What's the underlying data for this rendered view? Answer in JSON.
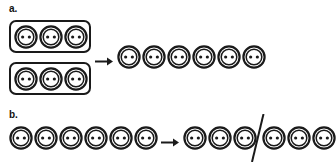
{
  "figure": {
    "background_color": "#ffffff",
    "stroke_color": "#1a1a1a",
    "parts": [
      {
        "label": "a.",
        "label_pos": {
          "x": 9,
          "y": 4
        },
        "operation": "combine",
        "groups": [
          {
            "kind": "boxed-group",
            "count": 3,
            "box": {
              "x": 9,
              "y": 20,
              "w": 82,
              "h": 33
            }
          },
          {
            "kind": "boxed-group",
            "count": 3,
            "box": {
              "x": 9,
              "y": 62,
              "w": 82,
              "h": 33
            }
          }
        ],
        "arrow": {
          "x": 95,
          "y": 57,
          "w": 18,
          "h": 8,
          "direction": "right"
        },
        "result": {
          "kind": "row",
          "count": 6,
          "x": 117,
          "y": 45,
          "spacing": 25
        }
      },
      {
        "label": "b.",
        "label_pos": {
          "x": 9,
          "y": 110
        },
        "operation": "partition",
        "source": {
          "kind": "row",
          "count": 6,
          "x": 9,
          "y": 126,
          "spacing": 25
        },
        "arrow": {
          "x": 161,
          "y": 138,
          "w": 18,
          "h": 8,
          "direction": "right"
        },
        "result_groups": [
          {
            "kind": "row",
            "count": 3,
            "x": 183,
            "y": 126,
            "spacing": 25
          },
          {
            "kind": "row",
            "count": 3,
            "x": 262,
            "y": 126,
            "spacing": 25
          }
        ],
        "divider": {
          "kind": "slash",
          "x": 250,
          "y": 116,
          "w": 14,
          "h": 44
        }
      }
    ],
    "icon": {
      "name": "sewing-button-icon",
      "diameter": 24,
      "outer_ring_color": "#1a1a1a",
      "inner_ring_color": "#1a1a1a",
      "face_color": "#ffffff",
      "hole_color": "#1a1a1a",
      "hole_count": 2
    }
  }
}
